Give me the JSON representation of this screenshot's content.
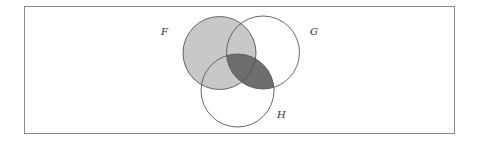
{
  "diagram": {
    "type": "venn",
    "sets": [
      {
        "name": "F",
        "cx": 219.5,
        "cy": 53,
        "r": 36.5
      },
      {
        "name": "G",
        "cx": 263,
        "cy": 52.5,
        "r": 36.5
      },
      {
        "name": "H",
        "cx": 237.5,
        "cy": 90.5,
        "r": 36.5
      }
    ],
    "labels": {
      "F": "F",
      "G": "G",
      "H": "H"
    },
    "shading": {
      "F": "#c8c8c8",
      "G_and_H": "#6e6e6e"
    },
    "stroke_color": "#555555",
    "frame_color": "#8a8a8a"
  }
}
